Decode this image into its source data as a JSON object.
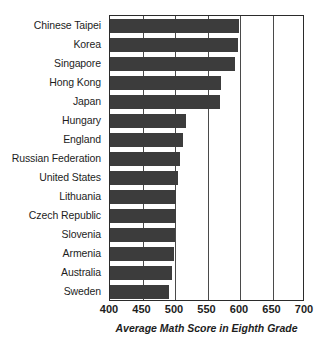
{
  "chart_data": {
    "type": "bar",
    "orientation": "horizontal",
    "title": "",
    "xlabel": "Average Math Score in Eighth Grade",
    "ylabel": "",
    "xlim": [
      400,
      700
    ],
    "xticks": [
      400,
      450,
      500,
      550,
      600,
      650,
      700
    ],
    "grid": true,
    "legend": false,
    "categories": [
      "Chinese Taipei",
      "Korea",
      "Singapore",
      "Hong Kong",
      "Japan",
      "Hungary",
      "England",
      "Russian Federation",
      "United States",
      "Lithuania",
      "Czech Republic",
      "Slovenia",
      "Armenia",
      "Australia",
      "Sweden"
    ],
    "values": [
      598,
      597,
      593,
      570,
      569,
      517,
      513,
      508,
      505,
      502,
      501,
      500,
      499,
      496,
      491
    ],
    "bar_color": "#3c3c3c"
  },
  "axis": {
    "tick_labels": [
      "400",
      "450",
      "500",
      "550",
      "600",
      "650",
      "700"
    ],
    "title": "Average Math Score in Eighth Grade"
  },
  "colors": {
    "bar": "#3c3c3c",
    "axis": "#2b2b2b",
    "grid": "#4a4a4a",
    "background": "#ffffff",
    "text": "#1d1d1d"
  }
}
